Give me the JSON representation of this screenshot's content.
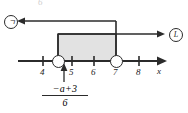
{
  "diagram": {
    "type": "number-line",
    "axis_label": "x",
    "top_fragment": "6",
    "tick_labels": [
      "4",
      "5",
      "6",
      "7",
      "8"
    ],
    "tick_values": [
      4,
      5,
      6,
      7,
      8
    ],
    "endpoints": [
      {
        "value": 4.5,
        "style": "open-circle"
      },
      {
        "value": 7,
        "style": "open-circle"
      }
    ],
    "shaded_region": {
      "from": 4.5,
      "to": 7,
      "fill": "#e2e2e2",
      "border": "#2b2b2b"
    },
    "annotations": [
      {
        "name": "left-callout",
        "label": "ㄱ",
        "direction": "left"
      },
      {
        "name": "right-callout",
        "label": "L",
        "direction": "right"
      }
    ],
    "expression": {
      "numerator": "−a+3",
      "denominator": "6"
    },
    "colors": {
      "ink": "#2b2b2b",
      "fill": "#e2e2e2",
      "background": "#ffffff"
    }
  }
}
